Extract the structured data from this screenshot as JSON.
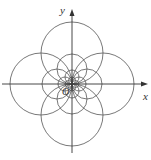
{
  "diagram": {
    "type": "polar-curves-family",
    "labels": {
      "y_axis": "y",
      "x_axis": "x",
      "origin": "O"
    },
    "origin_px": [
      72,
      84
    ],
    "circle_radii_px": [
      31,
      15,
      7,
      3.5
    ],
    "stroke_color": "#444444",
    "axis_color": "#333333"
  }
}
